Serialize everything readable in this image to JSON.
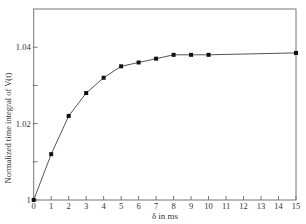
{
  "chart_data": {
    "type": "line",
    "title": "",
    "xlabel": "δ in ms",
    "ylabel": "Normalized time integral of V(t)",
    "xlim": [
      0,
      15
    ],
    "ylim": [
      1.0,
      1.05
    ],
    "x_ticks": [
      0,
      1,
      2,
      3,
      4,
      5,
      6,
      7,
      8,
      9,
      10,
      11,
      12,
      13,
      14,
      15
    ],
    "x_tick_labels": [
      "0",
      "1",
      "2",
      "3",
      "4",
      "5",
      "6",
      "7",
      "8",
      "9",
      "10",
      "11",
      "12",
      "13",
      "14",
      "15"
    ],
    "y_ticks": [
      1.0,
      1.01,
      1.02,
      1.03,
      1.04
    ],
    "y_tick_labels": [
      "1",
      "",
      "1.02",
      "",
      "1.04"
    ],
    "grid": false,
    "legend": null,
    "marker": "square",
    "series": [
      {
        "name": "Normalized time integral",
        "x": [
          0,
          1,
          2,
          3,
          4,
          5,
          6,
          7,
          8,
          9,
          10,
          15
        ],
        "y": [
          1.0,
          1.012,
          1.022,
          1.028,
          1.032,
          1.035,
          1.036,
          1.037,
          1.038,
          1.038,
          1.038,
          1.0385
        ]
      }
    ]
  },
  "style": {
    "line_color": "#555555",
    "marker_color": "#111111",
    "axis_color": "#777777",
    "text_color": "#333333"
  }
}
